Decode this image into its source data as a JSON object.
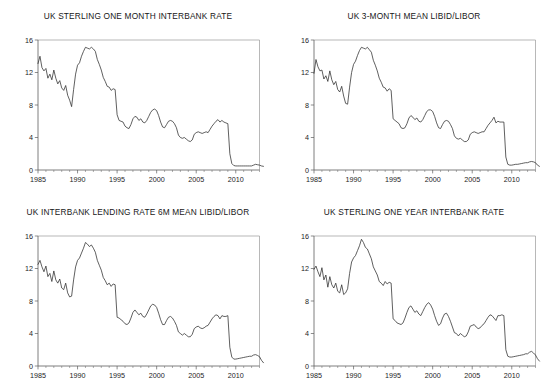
{
  "figure": {
    "layout": "2x2 grid of line charts",
    "panel_count": 4
  },
  "chart_data": [
    {
      "type": "line",
      "title": "UK STERLING ONE MONTH INTERBANK RATE",
      "xlabel": "",
      "ylabel": "",
      "xlim": [
        1985.0,
        2013.0
      ],
      "ylim": [
        0,
        16
      ],
      "yticks": [
        0,
        4,
        8,
        12,
        16
      ],
      "xticks": [
        1985,
        1990,
        1995,
        2000,
        2005,
        2010
      ],
      "xtick_labels": [
        "1985",
        "1990",
        "1995",
        "2000",
        "2005",
        "2010"
      ],
      "ytick_labels": [
        "0",
        "4",
        "8",
        "12",
        "16"
      ],
      "grid": false,
      "legend": "none",
      "series": [
        {
          "name": "UK Sterling One Month Interbank Rate",
          "x_start": 1985.0,
          "x_step": 0.25,
          "values": [
            13.1,
            14.0,
            12.6,
            12.2,
            12.5,
            11.3,
            11.8,
            11.1,
            12.3,
            11.3,
            10.6,
            11.0,
            10.1,
            9.8,
            10.4,
            9.2,
            8.6,
            7.8,
            9.9,
            11.8,
            12.9,
            13.2,
            14.0,
            14.6,
            15.1,
            15.0,
            14.9,
            15.1,
            14.9,
            14.6,
            13.6,
            13.0,
            12.3,
            11.4,
            10.9,
            10.3,
            10.2,
            9.8,
            10.0,
            9.9,
            6.8,
            6.1,
            6.0,
            5.9,
            5.4,
            5.2,
            5.1,
            5.6,
            6.3,
            6.6,
            6.5,
            6.1,
            6.3,
            5.9,
            5.8,
            6.1,
            6.6,
            7.1,
            7.4,
            7.5,
            7.3,
            6.7,
            5.9,
            5.3,
            5.2,
            5.6,
            6.0,
            6.1,
            6.0,
            5.7,
            5.2,
            4.3,
            4.0,
            3.9,
            4.0,
            3.8,
            3.6,
            3.5,
            3.7,
            4.4,
            4.6,
            4.7,
            4.6,
            4.5,
            4.6,
            4.7,
            4.6,
            5.0,
            5.4,
            5.7,
            6.0,
            6.2,
            5.9,
            6.1,
            5.9,
            5.8,
            5.7,
            2.0,
            0.8,
            0.55,
            0.5,
            0.5,
            0.5,
            0.5,
            0.5,
            0.5,
            0.5,
            0.5,
            0.5,
            0.6,
            0.7,
            0.65,
            0.6,
            0.5,
            0.45
          ]
        }
      ]
    },
    {
      "type": "line",
      "title": "UK 3-MONTH MEAN LIBID/LIBOR",
      "xlabel": "",
      "ylabel": "",
      "xlim": [
        1985.0,
        2013.0
      ],
      "ylim": [
        0,
        16
      ],
      "yticks": [
        0,
        4,
        8,
        12,
        16
      ],
      "xticks": [
        1985,
        1990,
        1995,
        2000,
        2005,
        2010
      ],
      "xtick_labels": [
        "1985",
        "1990",
        "1995",
        "2000",
        "2005",
        "2010"
      ],
      "ytick_labels": [
        "0",
        "4",
        "8",
        "12",
        "16"
      ],
      "grid": false,
      "legend": "none",
      "series": [
        {
          "name": "UK 3-Month Mean LIBID/LIBOR",
          "x_start": 1985.0,
          "x_step": 0.25,
          "values": [
            11.9,
            13.6,
            12.7,
            12.2,
            12.3,
            11.2,
            11.6,
            10.9,
            12.2,
            11.1,
            10.5,
            10.9,
            9.9,
            9.6,
            10.3,
            9.1,
            8.2,
            8.1,
            10.2,
            12.0,
            13.0,
            13.4,
            14.1,
            14.7,
            15.1,
            15.0,
            14.9,
            15.1,
            14.8,
            14.5,
            13.5,
            12.9,
            12.2,
            11.3,
            10.8,
            10.2,
            10.1,
            9.7,
            10.0,
            9.8,
            6.3,
            6.1,
            5.9,
            5.7,
            5.2,
            5.1,
            5.2,
            5.7,
            6.4,
            6.7,
            6.5,
            6.2,
            6.4,
            6.0,
            5.9,
            6.2,
            6.7,
            7.2,
            7.4,
            7.4,
            7.2,
            6.6,
            5.8,
            5.2,
            5.1,
            5.6,
            6.0,
            6.1,
            6.0,
            5.6,
            5.1,
            4.2,
            3.9,
            3.8,
            3.9,
            3.7,
            3.5,
            3.5,
            3.7,
            4.4,
            4.6,
            4.7,
            4.6,
            4.5,
            4.6,
            4.7,
            4.7,
            5.1,
            5.5,
            5.8,
            6.1,
            6.5,
            5.8,
            6.0,
            5.9,
            5.9,
            5.9,
            1.6,
            0.7,
            0.6,
            0.6,
            0.65,
            0.7,
            0.7,
            0.75,
            0.8,
            0.85,
            0.9,
            0.9,
            1.0,
            1.05,
            1.0,
            0.9,
            0.6,
            0.45
          ]
        }
      ]
    },
    {
      "type": "line",
      "title": "UK INTERBANK LENDING RATE 6M MEAN LIBID/LIBOR",
      "xlabel": "",
      "ylabel": "",
      "xlim": [
        1985.0,
        2013.0
      ],
      "ylim": [
        0,
        16
      ],
      "yticks": [
        0,
        4,
        8,
        12,
        16
      ],
      "xticks": [
        1985,
        1990,
        1995,
        2000,
        2005,
        2010
      ],
      "xtick_labels": [
        "1985",
        "1990",
        "1995",
        "2000",
        "2005",
        "2010"
      ],
      "ytick_labels": [
        "0",
        "4",
        "8",
        "12",
        "16"
      ],
      "grid": false,
      "legend": "none",
      "series": [
        {
          "name": "UK Interbank Lending Rate 6M Mean LIBID/LIBOR",
          "x_start": 1985.0,
          "x_step": 0.25,
          "values": [
            12.5,
            13.0,
            12.2,
            11.6,
            12.3,
            11.0,
            11.4,
            10.4,
            11.7,
            10.6,
            10.2,
            10.7,
            9.6,
            9.4,
            10.2,
            9.0,
            8.5,
            8.6,
            10.6,
            12.2,
            13.0,
            13.3,
            13.9,
            14.5,
            15.2,
            15.0,
            14.7,
            14.9,
            14.5,
            14.0,
            13.0,
            12.4,
            11.8,
            10.9,
            10.5,
            10.0,
            10.2,
            9.8,
            10.1,
            10.0,
            6.0,
            5.9,
            5.7,
            5.5,
            5.2,
            5.1,
            5.3,
            5.9,
            6.6,
            6.9,
            6.6,
            6.3,
            6.5,
            6.1,
            6.0,
            6.4,
            6.9,
            7.4,
            7.6,
            7.5,
            7.2,
            6.5,
            5.7,
            5.1,
            5.1,
            5.6,
            6.0,
            6.1,
            5.9,
            5.5,
            5.0,
            4.2,
            4.0,
            3.8,
            4.0,
            3.8,
            3.6,
            3.6,
            3.9,
            4.6,
            4.8,
            4.9,
            4.7,
            4.6,
            4.7,
            4.9,
            5.0,
            5.4,
            5.8,
            6.1,
            6.3,
            6.2,
            5.8,
            6.2,
            6.1,
            6.1,
            6.2,
            2.3,
            1.1,
            0.85,
            0.85,
            0.9,
            0.95,
            1.0,
            1.05,
            1.1,
            1.15,
            1.2,
            1.2,
            1.35,
            1.4,
            1.3,
            1.15,
            0.7,
            0.4
          ]
        }
      ]
    },
    {
      "type": "line",
      "title": "UK STERLING ONE YEAR INTERBANK RATE",
      "xlabel": "",
      "ylabel": "",
      "xlim": [
        1985.0,
        2013.0
      ],
      "ylim": [
        0,
        16
      ],
      "yticks": [
        0,
        4,
        8,
        12,
        16
      ],
      "xticks": [
        1985,
        1990,
        1995,
        2000,
        2005,
        2010
      ],
      "xtick_labels": [
        "1985",
        "1990",
        "1995",
        "2000",
        "2005",
        "2010"
      ],
      "ytick_labels": [
        "0",
        "4",
        "8",
        "12",
        "16"
      ],
      "grid": false,
      "legend": "none",
      "series": [
        {
          "name": "UK Sterling One Year Interbank Rate",
          "x_start": 1985.0,
          "x_step": 0.25,
          "values": [
            11.9,
            12.3,
            11.6,
            11.0,
            12.1,
            10.6,
            11.2,
            9.7,
            11.0,
            10.0,
            9.6,
            10.2,
            9.2,
            9.0,
            10.0,
            8.8,
            9.0,
            9.5,
            11.4,
            12.8,
            13.3,
            13.6,
            14.2,
            14.8,
            15.6,
            15.2,
            14.6,
            14.4,
            13.8,
            13.2,
            12.2,
            11.7,
            11.2,
            10.4,
            10.2,
            9.9,
            10.4,
            10.1,
            10.3,
            10.2,
            5.8,
            5.6,
            5.3,
            5.2,
            5.1,
            5.3,
            5.9,
            6.6,
            7.2,
            7.4,
            7.0,
            6.6,
            6.8,
            6.4,
            6.2,
            6.7,
            7.2,
            7.6,
            7.8,
            7.5,
            7.0,
            6.2,
            5.5,
            5.0,
            5.2,
            5.9,
            6.4,
            6.5,
            6.1,
            5.5,
            4.8,
            4.1,
            4.0,
            3.7,
            4.0,
            3.8,
            3.6,
            3.7,
            4.2,
            4.9,
            5.0,
            5.1,
            4.8,
            4.6,
            4.7,
            5.0,
            5.2,
            5.6,
            6.0,
            6.3,
            6.2,
            5.9,
            5.6,
            6.2,
            6.2,
            6.3,
            6.2,
            2.0,
            1.2,
            1.1,
            1.1,
            1.15,
            1.2,
            1.25,
            1.3,
            1.35,
            1.4,
            1.5,
            1.5,
            1.7,
            1.8,
            1.6,
            1.35,
            0.9,
            0.6
          ]
        }
      ]
    }
  ]
}
